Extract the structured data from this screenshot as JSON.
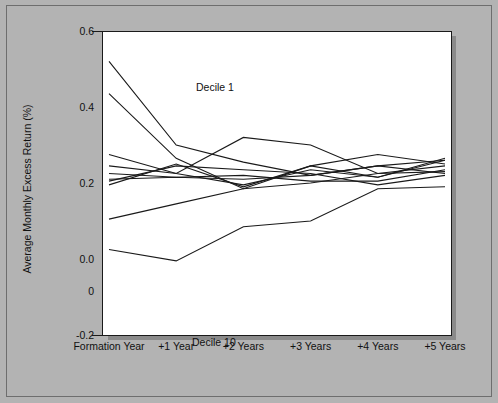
{
  "figure": {
    "background_color": "#b3b3b3",
    "plot_background_color": "#ffffff",
    "line_color": "#1a1a1a"
  },
  "annotations": {
    "top_label": "Decile 1",
    "bottom_label": "Decile 10"
  },
  "chart_data": {
    "type": "line",
    "title": "",
    "subtitle": "",
    "xlabel": "",
    "ylabel": "Average Monthly Excess Return (%)",
    "categories": [
      "Formation Year",
      "+1 Year",
      "+2 Years",
      "+3 Years",
      "+4 Years",
      "+5 Years"
    ],
    "x_tick_labels": [
      "Formation Year",
      "+1 Year",
      "+2 Years",
      "+3 Years",
      "+4 Years",
      "+5 Years"
    ],
    "y_tick_labels": [
      "0.6",
      "0.4",
      "0.2",
      "0.0",
      "0",
      "-0.2"
    ],
    "y_ticks": [
      0.6,
      0.4,
      0.2,
      0.0,
      -0.2
    ],
    "ylim": [
      -0.2,
      0.6
    ],
    "xlim": [
      0,
      5
    ],
    "grid": false,
    "legend": false,
    "legend_position": "none",
    "annotations": [
      {
        "text": "Decile 1",
        "x": 0.1,
        "y": 0.54
      },
      {
        "text": "Decile 10",
        "x": 0.05,
        "y": -0.13
      }
    ],
    "series": [
      {
        "name": "Decile 1",
        "values": [
          0.52,
          0.3,
          0.255,
          0.22,
          0.245,
          0.26
        ]
      },
      {
        "name": "Decile 2",
        "values": [
          0.435,
          0.265,
          0.185,
          0.245,
          0.275,
          0.25
        ]
      },
      {
        "name": "Decile 3",
        "values": [
          0.275,
          0.225,
          0.195,
          0.235,
          0.215,
          0.265
        ]
      },
      {
        "name": "Decile 4",
        "values": [
          0.245,
          0.225,
          0.32,
          0.3,
          0.225,
          0.245
        ]
      },
      {
        "name": "Decile 5",
        "values": [
          0.225,
          0.215,
          0.22,
          0.205,
          0.205,
          0.235
        ]
      },
      {
        "name": "Decile 6",
        "values": [
          0.21,
          0.215,
          0.21,
          0.22,
          0.245,
          0.225
        ]
      },
      {
        "name": "Decile 7",
        "values": [
          0.205,
          0.245,
          0.235,
          0.225,
          0.195,
          0.22
        ]
      },
      {
        "name": "Decile 8",
        "values": [
          0.195,
          0.25,
          0.19,
          0.245,
          0.215,
          0.26
        ]
      },
      {
        "name": "Decile 9",
        "values": [
          0.105,
          0.145,
          0.185,
          0.2,
          0.225,
          0.23
        ]
      },
      {
        "name": "Decile 10",
        "values": [
          0.025,
          -0.005,
          0.085,
          0.1,
          0.185,
          0.19
        ]
      }
    ]
  }
}
